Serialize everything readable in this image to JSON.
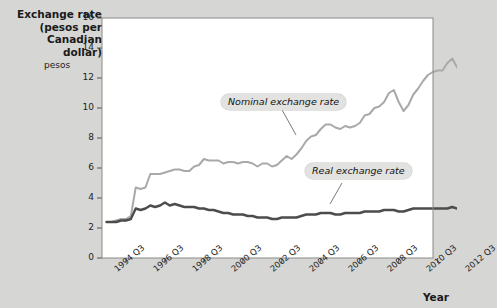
{
  "chart_data": {
    "type": "line",
    "title": "Exchange rate\n(pesos per\nCanadian dollar)",
    "xlabel": "Year",
    "ylabel": "pesos",
    "ylim": [
      0,
      16
    ],
    "yticks": [
      0,
      2,
      4,
      6,
      8,
      10,
      12,
      14,
      16
    ],
    "xticks": [
      "1994 Q3",
      "1996 Q3",
      "1998 Q3",
      "2000 Q3",
      "2002 Q3",
      "2004 Q3",
      "2006 Q3",
      "2008 Q3",
      "2010 Q3",
      "2012 Q3"
    ],
    "xlim": [
      "1993 Q3",
      "2013 Q1"
    ],
    "grid": false,
    "legend_position": "inline-callouts",
    "annotations": [
      {
        "text": "Nominal exchange rate",
        "series": "nominal"
      },
      {
        "text": "Real exchange rate",
        "series": "real"
      }
    ],
    "series": [
      {
        "name": "Nominal exchange rate",
        "color": "#a9a9a7",
        "x": [
          "1993 Q3",
          "1993 Q4",
          "1994 Q1",
          "1994 Q2",
          "1994 Q3",
          "1994 Q4",
          "1995 Q1",
          "1995 Q2",
          "1995 Q3",
          "1995 Q4",
          "1996 Q1",
          "1996 Q2",
          "1996 Q3",
          "1996 Q4",
          "1997 Q1",
          "1997 Q2",
          "1997 Q3",
          "1997 Q4",
          "1998 Q1",
          "1998 Q2",
          "1998 Q3",
          "1998 Q4",
          "1999 Q1",
          "1999 Q2",
          "1999 Q3",
          "1999 Q4",
          "2000 Q1",
          "2000 Q2",
          "2000 Q3",
          "2000 Q4",
          "2001 Q1",
          "2001 Q2",
          "2001 Q3",
          "2001 Q4",
          "2002 Q1",
          "2002 Q2",
          "2002 Q3",
          "2002 Q4",
          "2003 Q1",
          "2003 Q2",
          "2003 Q3",
          "2003 Q4",
          "2004 Q1",
          "2004 Q2",
          "2004 Q3",
          "2004 Q4",
          "2005 Q1",
          "2005 Q2",
          "2005 Q3",
          "2005 Q4",
          "2006 Q1",
          "2006 Q2",
          "2006 Q3",
          "2006 Q4",
          "2007 Q1",
          "2007 Q2",
          "2007 Q3",
          "2007 Q4",
          "2008 Q1",
          "2008 Q2",
          "2008 Q3",
          "2008 Q4",
          "2009 Q1",
          "2009 Q2",
          "2009 Q3",
          "2009 Q4",
          "2010 Q1",
          "2010 Q2",
          "2010 Q3",
          "2010 Q4",
          "2011 Q1",
          "2011 Q2",
          "2011 Q3",
          "2011 Q4",
          "2012 Q1",
          "2012 Q2",
          "2012 Q3",
          "2012 Q4"
        ],
        "values": [
          2.4,
          2.4,
          2.5,
          2.6,
          2.6,
          2.8,
          4.7,
          4.6,
          4.7,
          5.6,
          5.6,
          5.6,
          5.7,
          5.8,
          5.9,
          5.9,
          5.8,
          5.8,
          6.1,
          6.2,
          6.6,
          6.5,
          6.5,
          6.5,
          6.3,
          6.4,
          6.4,
          6.3,
          6.4,
          6.4,
          6.3,
          6.1,
          6.3,
          6.3,
          6.1,
          6.2,
          6.5,
          6.8,
          6.6,
          6.9,
          7.3,
          7.8,
          8.1,
          8.2,
          8.6,
          8.9,
          8.9,
          8.7,
          8.6,
          8.8,
          8.7,
          8.8,
          9.0,
          9.5,
          9.6,
          10.0,
          10.1,
          10.4,
          11.0,
          11.2,
          10.4,
          9.8,
          10.2,
          10.9,
          11.3,
          11.8,
          12.2,
          12.4,
          12.5,
          12.5,
          13.0,
          13.3,
          12.7,
          13.0,
          13.3,
          13.1,
          13.4,
          13.3
        ]
      },
      {
        "name": "Real exchange rate",
        "color": "#4c4c4c",
        "x": [
          "1993 Q3",
          "1993 Q4",
          "1994 Q1",
          "1994 Q2",
          "1994 Q3",
          "1994 Q4",
          "1995 Q1",
          "1995 Q2",
          "1995 Q3",
          "1995 Q4",
          "1996 Q1",
          "1996 Q2",
          "1996 Q3",
          "1996 Q4",
          "1997 Q1",
          "1997 Q2",
          "1997 Q3",
          "1997 Q4",
          "1998 Q1",
          "1998 Q2",
          "1998 Q3",
          "1998 Q4",
          "1999 Q1",
          "1999 Q2",
          "1999 Q3",
          "1999 Q4",
          "2000 Q1",
          "2000 Q2",
          "2000 Q3",
          "2000 Q4",
          "2001 Q1",
          "2001 Q2",
          "2001 Q3",
          "2001 Q4",
          "2002 Q1",
          "2002 Q2",
          "2002 Q3",
          "2002 Q4",
          "2003 Q1",
          "2003 Q2",
          "2003 Q3",
          "2003 Q4",
          "2004 Q1",
          "2004 Q2",
          "2004 Q3",
          "2004 Q4",
          "2005 Q1",
          "2005 Q2",
          "2005 Q3",
          "2005 Q4",
          "2006 Q1",
          "2006 Q2",
          "2006 Q3",
          "2006 Q4",
          "2007 Q1",
          "2007 Q2",
          "2007 Q3",
          "2007 Q4",
          "2008 Q1",
          "2008 Q2",
          "2008 Q3",
          "2008 Q4",
          "2009 Q1",
          "2009 Q2",
          "2009 Q3",
          "2009 Q4",
          "2010 Q1",
          "2010 Q2",
          "2010 Q3",
          "2010 Q4",
          "2011 Q1",
          "2011 Q2",
          "2011 Q3",
          "2011 Q4",
          "2012 Q1",
          "2012 Q2",
          "2012 Q3",
          "2012 Q4"
        ],
        "values": [
          2.4,
          2.4,
          2.4,
          2.5,
          2.5,
          2.6,
          3.3,
          3.2,
          3.3,
          3.5,
          3.4,
          3.5,
          3.7,
          3.5,
          3.6,
          3.5,
          3.4,
          3.4,
          3.4,
          3.3,
          3.3,
          3.2,
          3.2,
          3.1,
          3.0,
          3.0,
          2.9,
          2.9,
          2.9,
          2.8,
          2.8,
          2.7,
          2.7,
          2.7,
          2.6,
          2.6,
          2.7,
          2.7,
          2.7,
          2.7,
          2.8,
          2.9,
          2.9,
          2.9,
          3.0,
          3.0,
          3.0,
          2.9,
          2.9,
          3.0,
          3.0,
          3.0,
          3.0,
          3.1,
          3.1,
          3.1,
          3.1,
          3.2,
          3.2,
          3.2,
          3.1,
          3.1,
          3.2,
          3.3,
          3.3,
          3.3,
          3.3,
          3.3,
          3.3,
          3.3,
          3.3,
          3.4,
          3.3,
          3.3,
          3.4,
          3.3,
          3.4,
          3.4
        ]
      }
    ]
  }
}
